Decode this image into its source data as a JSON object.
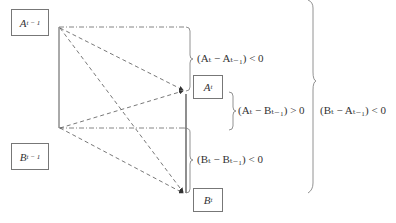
{
  "nodes": {
    "a_prev": {
      "base": "A",
      "sub": "t − 1"
    },
    "b_prev": {
      "base": "B",
      "sub": "t − 1"
    },
    "a_curr": {
      "base": "A",
      "sub": "t"
    },
    "b_curr": {
      "base": "B",
      "sub": "t"
    }
  },
  "conditions": {
    "a_change": "(Aₜ − Aₜ₋₁) < 0",
    "a_minus_bprev": "(Aₜ − Bₜ₋₁) > 0",
    "b_change": "(Bₜ − Bₜ₋₁) < 0",
    "b_minus_aprev": "(Bₜ − Aₜ₋₁) < 0"
  },
  "colors": {
    "line": "#555555",
    "box_border": "#777777"
  }
}
